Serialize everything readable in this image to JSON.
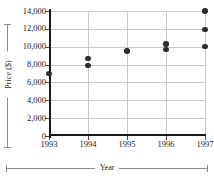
{
  "chart_data": {
    "type": "scatter",
    "title": "",
    "xlabel": "Year",
    "ylabel": "Price ($)",
    "xlim": [
      1993,
      1997
    ],
    "ylim": [
      0,
      14000
    ],
    "grid": true,
    "legend": false,
    "x_tick_labels": [
      "1993",
      "1994",
      "1995",
      "1996",
      "1997"
    ],
    "x_ticks": [
      1993,
      1994,
      1995,
      1996,
      1997
    ],
    "y_tick_labels": [
      "0",
      "2,000",
      "4,000",
      "6,000",
      "8,000",
      "10,000",
      "12,000",
      "14,000"
    ],
    "y_ticks": [
      0,
      2000,
      4000,
      6000,
      8000,
      10000,
      12000,
      14000
    ],
    "points": [
      {
        "x": 1993,
        "y": 7000
      },
      {
        "x": 1994,
        "y": 8700
      },
      {
        "x": 1994,
        "y": 7900
      },
      {
        "x": 1995,
        "y": 9500
      },
      {
        "x": 1996,
        "y": 10300
      },
      {
        "x": 1996,
        "y": 9700
      },
      {
        "x": 1997,
        "y": 14000
      },
      {
        "x": 1997,
        "y": 11900
      },
      {
        "x": 1997,
        "y": 10000
      }
    ],
    "marker": {
      "shape": "circle",
      "color": "#2e2e2e",
      "size": 5
    },
    "colors": {
      "marker": "#2e2e2e",
      "axis": "#1a1a1a",
      "gridline": "#c9c9c9",
      "bracket": "#8a8a8a",
      "background": "#ffffff",
      "text": "#1a1a1a"
    }
  }
}
